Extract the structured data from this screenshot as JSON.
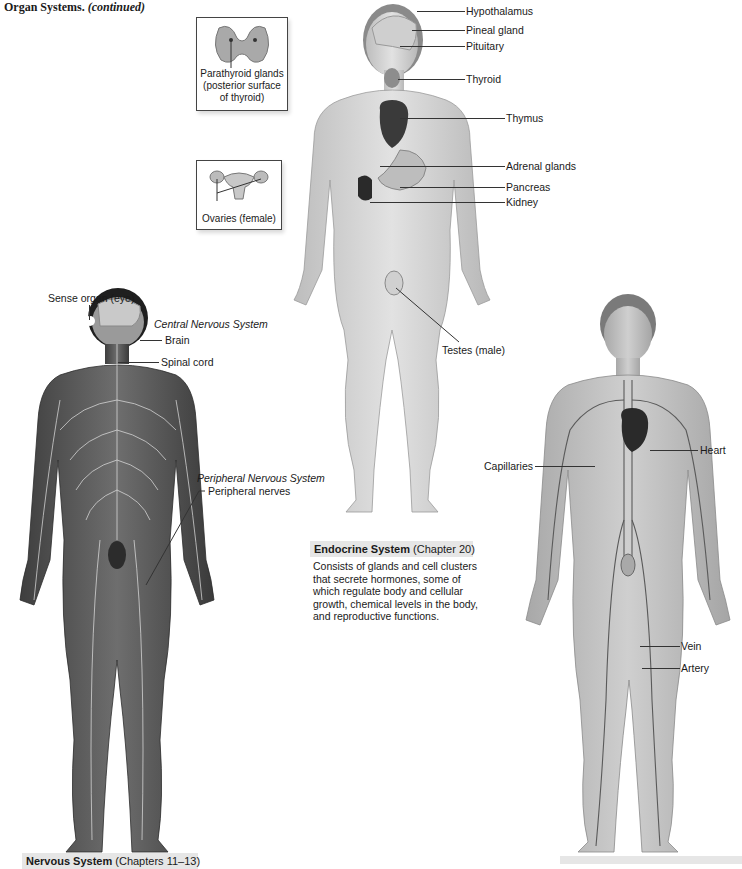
{
  "header": {
    "title": "Organ Systems.",
    "title_suffix": "(continued)"
  },
  "endocrine": {
    "caption_name": "Endocrine System",
    "caption_chapter": "(Chapter 20)",
    "description": "Consists of glands and cell clusters that secrete hormones, some of which regulate body and cellular growth, chemical levels in the body, and reproductive functions.",
    "labels": {
      "hypothalamus": "Hypothalamus",
      "pineal": "Pineal gland",
      "pituitary": "Pituitary",
      "thyroid": "Thyroid",
      "thymus": "Thymus",
      "adrenal": "Adrenal glands",
      "pancreas": "Pancreas",
      "kidney": "Kidney",
      "testes": "Testes (male)"
    },
    "insets": {
      "parathyroid": "Parathyroid glands (posterior surface of thyroid)",
      "parathyroid_lines": [
        "Parathyroid glands",
        "(posterior surface",
        "of thyroid)"
      ],
      "ovaries": "Ovaries (female)"
    }
  },
  "nervous": {
    "caption_name": "Nervous System",
    "caption_chapter": "(Chapters 11–13)",
    "labels": {
      "sense_organ": "Sense organ (eye)",
      "cns_heading": "Central Nervous System",
      "brain": "Brain",
      "spinal_cord": "Spinal cord",
      "pns_heading": "Peripheral Nervous System",
      "peripheral_nerves": "Peripheral nerves"
    }
  },
  "cardiovascular": {
    "labels": {
      "heart": "Heart",
      "capillaries": "Capillaries",
      "vein": "Vein",
      "artery": "Artery"
    }
  },
  "colors": {
    "skin_light": "#d8d8d8",
    "skin_dark": "#5a5a5a",
    "caption_bg": "#e6e6e6",
    "line": "#333333"
  }
}
